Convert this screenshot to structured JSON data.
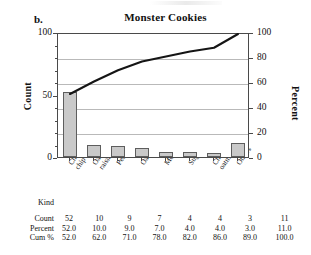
{
  "panel": {
    "label": "b."
  },
  "chart_data": {
    "type": "bar",
    "title": "Monster Cookies",
    "xlabel": "Kind",
    "ylabel": "Count",
    "y2label": "Percent",
    "grid": true,
    "legend": "none",
    "ylim": [
      0,
      100
    ],
    "y2lim": [
      0,
      100
    ],
    "yticks": [
      0,
      50,
      100
    ],
    "y2ticks": [
      0,
      20,
      40,
      60,
      80,
      100
    ],
    "categories": [
      "Chocolate chip",
      "Oatmeal raisin",
      "Peanut butter",
      "Oatmeal",
      "Molasses",
      "Sugar",
      "Choc. chip oatmeal",
      "Others"
    ],
    "series": [
      {
        "name": "Count",
        "type": "bar",
        "values": [
          52,
          10,
          9,
          7,
          4,
          4,
          3,
          11
        ]
      },
      {
        "name": "Cum %",
        "type": "line",
        "values": [
          52.0,
          62.0,
          71.0,
          78.0,
          82.0,
          86.0,
          89.0,
          100.0
        ]
      }
    ],
    "percent": [
      52.0,
      10.0,
      9.0,
      7.0,
      4.0,
      4.0,
      3.0,
      11.0
    ]
  },
  "table": {
    "row_headers": [
      "Kind",
      "Count",
      "Percent",
      "Cum %"
    ],
    "kinds": [
      "Chocolate\nchip",
      "Oatmeal\nraisin",
      "Peanut butter",
      "Oatmeal",
      "Molasses",
      "Sugar",
      "Choc. chip\noatmeal",
      "Others"
    ],
    "count": [
      "52",
      "10",
      "9",
      "7",
      "4",
      "4",
      "3",
      "11"
    ],
    "percent": [
      "52.0",
      "10.0",
      "9.0",
      "7.0",
      "4.0",
      "4.0",
      "3.0",
      "11.0"
    ],
    "cum": [
      "52.0",
      "62.0",
      "71.0",
      "78.0",
      "82.0",
      "86.0",
      "89.0",
      "100.0"
    ]
  },
  "colors": {
    "bar_fill": "#c9c9c9",
    "bar_stroke": "#5d5d5d",
    "line": "#151515",
    "grid": "#b9b9b9",
    "frame": "#4a4a4a"
  }
}
